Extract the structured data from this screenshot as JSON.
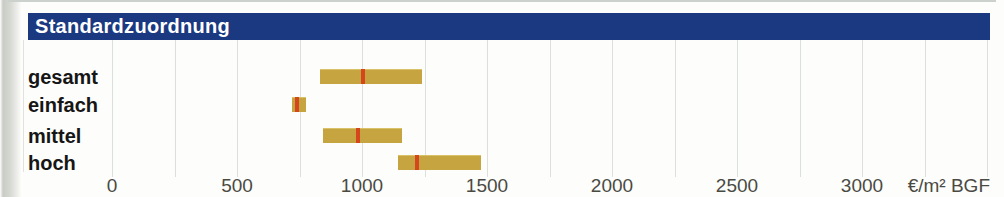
{
  "header": {
    "title": "Standardzuordnung"
  },
  "colors": {
    "header_bg": "#1a3980",
    "header_text": "#ffffff",
    "bar_fill": "#c6a440",
    "marker_red": "#d6461d",
    "gridline": "#dcdfdb",
    "axis_text": "#4a4a43",
    "category_text": "#161616"
  },
  "chart_data": {
    "type": "bar",
    "orientation": "horizontal-range",
    "title": "Standardzuordnung",
    "categories": [
      "gesamt",
      "einfach",
      "mittel",
      "hoch"
    ],
    "bars": [
      {
        "label": "gesamt",
        "from": 830,
        "to": 1240,
        "marker": 1005
      },
      {
        "label": "einfach",
        "from": 720,
        "to": 775,
        "marker": 740
      },
      {
        "label": "mittel",
        "from": 845,
        "to": 1160,
        "marker": 985
      },
      {
        "label": "hoch",
        "from": 1145,
        "to": 1475,
        "marker": 1220
      }
    ],
    "x_axis": {
      "tick_labels": [
        "0",
        "500",
        "1000",
        "1500",
        "2000",
        "2500",
        "3000"
      ],
      "tick_values": [
        0,
        500,
        1000,
        1500,
        2000,
        2500,
        3000
      ],
      "minor_step": 250,
      "range": [
        0,
        3500
      ],
      "unit_label": "€/m² BGF"
    },
    "grid": "vertical minor gridlines every 250",
    "legend": "none"
  }
}
